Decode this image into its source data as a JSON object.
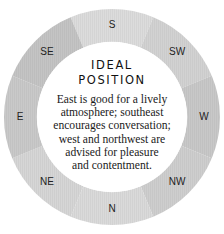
{
  "diagram": {
    "title_line1": "IDEAL",
    "title_line2": "POSITION",
    "description_lines": [
      "East is good for a lively",
      "atmosphere; southeast",
      "encourages conversation;",
      "west and northwest are",
      "advised for pleasure",
      "and contentment."
    ],
    "directions": [
      {
        "label": "S",
        "angle_deg": 0
      },
      {
        "label": "SW",
        "angle_deg": 45
      },
      {
        "label": "W",
        "angle_deg": 90
      },
      {
        "label": "NW",
        "angle_deg": 135
      },
      {
        "label": "N",
        "angle_deg": 180
      },
      {
        "label": "NE",
        "angle_deg": 225
      },
      {
        "label": "E",
        "angle_deg": 270
      },
      {
        "label": "SE",
        "angle_deg": 315
      }
    ],
    "colors": {
      "S": "#dcdcdc",
      "SW": "#d2d2d2",
      "W": "#c8c8c8",
      "NW": "#cecece",
      "N": "#dadada",
      "NE": "#d6d6d6",
      "E": "#c9c9c9",
      "SE": "#c4c4c4",
      "center": "#ffffff",
      "text": "#1a1a1a"
    }
  }
}
